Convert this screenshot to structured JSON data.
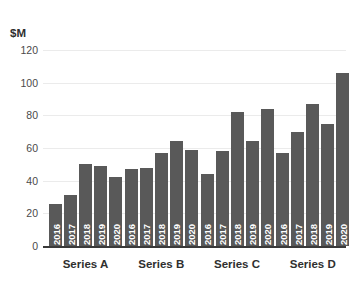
{
  "chart_data": {
    "type": "bar",
    "title": "",
    "subtitle": "",
    "xlabel": "",
    "ylabel": "$M",
    "ylim": [
      0,
      120
    ],
    "ytick_labels": [
      "120",
      "100",
      "80",
      "60",
      "40",
      "20",
      "0"
    ],
    "ytick_values": [
      120,
      100,
      80,
      60,
      40,
      20,
      0
    ],
    "grid": true,
    "legend": "none",
    "categories": [
      "Series A",
      "Series B",
      "Series C",
      "Series D"
    ],
    "x": [
      "2016",
      "2017",
      "2018",
      "2019",
      "2020"
    ],
    "bar_color": "#595959",
    "gridline_color": "#ebebeb",
    "axis_color": "#3a3a3a",
    "groups": [
      {
        "name": "Series A",
        "bars": [
          {
            "year": "2016",
            "value": 26
          },
          {
            "year": "2017",
            "value": 31
          },
          {
            "year": "2018",
            "value": 50
          },
          {
            "year": "2019",
            "value": 49
          },
          {
            "year": "2020",
            "value": 42
          }
        ]
      },
      {
        "name": "Series B",
        "bars": [
          {
            "year": "2016",
            "value": 47
          },
          {
            "year": "2017",
            "value": 48
          },
          {
            "year": "2018",
            "value": 57
          },
          {
            "year": "2019",
            "value": 64
          },
          {
            "year": "2020",
            "value": 59
          }
        ]
      },
      {
        "name": "Series C",
        "bars": [
          {
            "year": "2016",
            "value": 44
          },
          {
            "year": "2017",
            "value": 58
          },
          {
            "year": "2018",
            "value": 82
          },
          {
            "year": "2019",
            "value": 64
          },
          {
            "year": "2020",
            "value": 84
          }
        ]
      },
      {
        "name": "Series D",
        "bars": [
          {
            "year": "2016",
            "value": 57
          },
          {
            "year": "2017",
            "value": 70
          },
          {
            "year": "2018",
            "value": 87
          },
          {
            "year": "2019",
            "value": 75
          },
          {
            "year": "2020",
            "value": 106
          }
        ]
      }
    ],
    "series": [
      {
        "name": "2016",
        "values": [
          26,
          47,
          44,
          57
        ]
      },
      {
        "name": "2017",
        "values": [
          31,
          48,
          58,
          70
        ]
      },
      {
        "name": "2018",
        "values": [
          50,
          57,
          82,
          87
        ]
      },
      {
        "name": "2019",
        "values": [
          49,
          64,
          64,
          75
        ]
      },
      {
        "name": "2020",
        "values": [
          42,
          59,
          84,
          106
        ]
      }
    ]
  }
}
